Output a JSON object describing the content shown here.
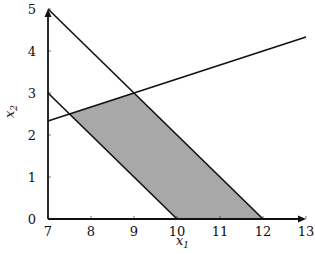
{
  "chart_data": {
    "type": "area",
    "title": "",
    "xlabel": "x_1",
    "ylabel": "x_2",
    "xlim": [
      7,
      13
    ],
    "ylim": [
      0,
      5
    ],
    "x_ticks": [
      "7",
      "8",
      "9",
      "10",
      "11",
      "12",
      "13"
    ],
    "y_ticks": [
      "0",
      "1",
      "2",
      "3",
      "4",
      "5"
    ],
    "grid": false,
    "lines": [
      {
        "name": "x1 + x2 = 12",
        "points": [
          [
            7,
            5
          ],
          [
            12,
            0
          ]
        ]
      },
      {
        "name": "x1 + x2 = 10",
        "points": [
          [
            7,
            3
          ],
          [
            10,
            0
          ]
        ]
      },
      {
        "name": "x2 = x1 / 3",
        "points": [
          [
            7,
            2.333
          ],
          [
            13,
            4.333
          ]
        ]
      }
    ],
    "feasible_region": {
      "fill": "#a8a8a8",
      "vertices": [
        [
          7.5,
          2.5
        ],
        [
          9,
          3
        ],
        [
          12,
          0
        ],
        [
          10,
          0
        ]
      ]
    }
  }
}
